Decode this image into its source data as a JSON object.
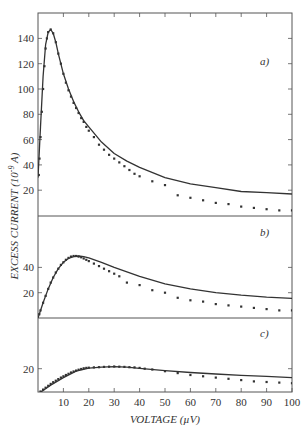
{
  "chart_data": [
    {
      "type": "line",
      "panel": "a)",
      "xlabel": "VOLTAGE (µV)",
      "ylabel": "EXCESS CURRENT (10^-9 A)",
      "xlim": [
        0,
        100
      ],
      "ylim": [
        0,
        150
      ],
      "yticks": [
        20,
        40,
        60,
        80,
        100,
        120,
        140
      ],
      "series": [
        {
          "name": "theory",
          "style": "solid-line",
          "x": [
            0,
            1,
            2,
            3,
            4,
            5,
            6,
            7,
            8,
            10,
            12,
            14,
            16,
            18,
            20,
            25,
            30,
            35,
            40,
            50,
            60,
            70,
            80,
            90,
            100
          ],
          "y": [
            30,
            70,
            110,
            135,
            145,
            147,
            144,
            137,
            128,
            112,
            100,
            90,
            82,
            75,
            70,
            58,
            49,
            43,
            38,
            30,
            25,
            22,
            19,
            18,
            17
          ]
        },
        {
          "name": "experiment",
          "style": "dots",
          "x": [
            0.3,
            0.6,
            1,
            1.5,
            2,
            2.5,
            3,
            3.5,
            4,
            5,
            6,
            7,
            8,
            9,
            10,
            11,
            12,
            13,
            14,
            15,
            16,
            17,
            18,
            19,
            20,
            22,
            24,
            26,
            28,
            30,
            32,
            34,
            36,
            38,
            40,
            45,
            50,
            55,
            60,
            65,
            70,
            75,
            80,
            85,
            90,
            95,
            100
          ],
          "y": [
            32,
            45,
            62,
            82,
            100,
            118,
            132,
            140,
            145,
            147,
            144,
            137,
            128,
            120,
            112,
            105,
            99,
            94,
            89,
            85,
            81,
            77,
            74,
            70,
            67,
            62,
            56,
            52,
            48,
            45,
            42,
            39,
            36,
            33,
            31,
            27,
            24,
            16,
            14,
            12,
            10,
            9,
            7,
            6,
            5,
            4,
            4
          ]
        }
      ]
    },
    {
      "type": "line",
      "panel": "b)",
      "xlim": [
        0,
        100
      ],
      "ylim": [
        0,
        70
      ],
      "yticks": [
        20,
        40
      ],
      "series": [
        {
          "name": "theory",
          "style": "solid-line",
          "x": [
            0,
            2,
            4,
            6,
            8,
            10,
            12,
            14,
            16,
            18,
            20,
            25,
            30,
            35,
            40,
            50,
            60,
            70,
            80,
            90,
            100
          ],
          "y": [
            0,
            12,
            23,
            32,
            39,
            44,
            47,
            48.5,
            49,
            48.5,
            47.5,
            44,
            40,
            36.5,
            33,
            27,
            23,
            20,
            18,
            16.5,
            15.5
          ]
        },
        {
          "name": "experiment",
          "style": "dots",
          "x": [
            0.5,
            1,
            2,
            3,
            4,
            5,
            6,
            7,
            8,
            9,
            10,
            11,
            12,
            13,
            14,
            15,
            16,
            17,
            18,
            19,
            20,
            22,
            24,
            26,
            28,
            30,
            32,
            35,
            40,
            45,
            50,
            55,
            60,
            65,
            70,
            75,
            80,
            85,
            90,
            95,
            100
          ],
          "y": [
            3,
            6,
            12,
            17.5,
            23,
            28,
            32,
            36,
            39,
            42,
            44,
            46,
            47.5,
            48.5,
            49,
            49,
            48.5,
            48,
            47,
            46,
            45,
            43,
            41,
            39,
            37,
            35,
            33,
            28,
            26,
            22,
            20,
            16,
            14,
            13,
            11,
            10,
            9,
            8,
            7,
            6,
            6
          ]
        }
      ]
    },
    {
      "type": "line",
      "panel": "c)",
      "xlim": [
        0,
        100
      ],
      "ylim": [
        0,
        45
      ],
      "yticks": [
        20
      ],
      "xticks": [
        10,
        20,
        30,
        40,
        50,
        60,
        70,
        80,
        90,
        100
      ],
      "series": [
        {
          "name": "theory",
          "style": "solid-line",
          "x": [
            0,
            5,
            10,
            15,
            20,
            25,
            30,
            35,
            40,
            50,
            60,
            70,
            80,
            90,
            100
          ],
          "y": [
            0,
            7,
            13,
            18,
            20.5,
            21.3,
            21.6,
            21.2,
            20.2,
            18.5,
            17,
            15.8,
            14.8,
            13.9,
            13
          ]
        },
        {
          "name": "experiment",
          "style": "dots",
          "x": [
            1,
            2,
            3,
            4,
            5,
            6,
            7,
            8,
            9,
            10,
            11,
            12,
            13,
            14,
            15,
            16,
            17,
            18,
            19,
            20,
            22,
            24,
            26,
            28,
            30,
            32,
            34,
            36,
            38,
            40,
            42,
            45,
            50,
            55,
            60,
            65,
            70,
            75,
            80,
            85,
            90,
            95,
            100
          ],
          "y": [
            2,
            3.5,
            5,
            6.5,
            8,
            9.3,
            10.5,
            11.8,
            13,
            14,
            15,
            16,
            17,
            17.8,
            18.5,
            19.2,
            19.8,
            20.3,
            20.6,
            20.8,
            21,
            21.2,
            21.4,
            21.6,
            21.7,
            21.6,
            21.4,
            21.2,
            21,
            20.6,
            20,
            19.4,
            18,
            16.5,
            15,
            14,
            13,
            12,
            11,
            10,
            9.5,
            9,
            8.5
          ]
        }
      ]
    }
  ],
  "labels": {
    "ylabel": "EXCESS CURRENT (10",
    "ylabel_exp": "-9",
    "ylabel_tail": " A)",
    "xlabel": "VOLTAGE (µV)",
    "panel_a": "a)",
    "panel_b": "b)",
    "panel_c": "c)"
  },
  "colors": {
    "ink": "#333333",
    "axis": "#555555",
    "background": "#ffffff"
  }
}
